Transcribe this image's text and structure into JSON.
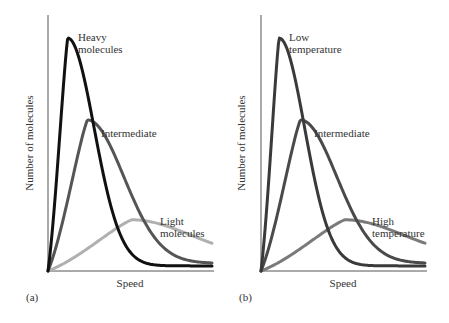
{
  "chart_data": [
    {
      "type": "line",
      "panel_label": "(a)",
      "title": "",
      "xlabel": "Speed",
      "ylabel": "Number of molecules",
      "grid": false,
      "ticks": false,
      "xlim": [
        0,
        1
      ],
      "ylim": [
        0,
        1
      ],
      "series": [
        {
          "name": "Heavy molecules",
          "label_lines": [
            "Heavy",
            "molecules"
          ],
          "color": "#111111",
          "peak_x": 0.12,
          "peak_y": 0.91,
          "tail_y": 0.02
        },
        {
          "name": "Intermediate",
          "label_lines": [
            "Intermediate"
          ],
          "color": "#555555",
          "peak_x": 0.24,
          "peak_y": 0.59,
          "tail_y": 0.03
        },
        {
          "name": "Light molecules",
          "label_lines": [
            "Light",
            "molecules"
          ],
          "color": "#b0b0b0",
          "peak_x": 0.51,
          "peak_y": 0.2,
          "tail_y": 0.05
        }
      ]
    },
    {
      "type": "line",
      "panel_label": "(b)",
      "title": "",
      "xlabel": "Speed",
      "ylabel": "Number of molecules",
      "grid": false,
      "ticks": false,
      "xlim": [
        0,
        1
      ],
      "ylim": [
        0,
        1
      ],
      "series": [
        {
          "name": "Low temperature",
          "label_lines": [
            "Low",
            "temperature"
          ],
          "color": "#3a3a3a",
          "peak_x": 0.11,
          "peak_y": 0.91,
          "tail_y": 0.02
        },
        {
          "name": "Intermediate",
          "label_lines": [
            "Intermediate"
          ],
          "color": "#4a4a4a",
          "peak_x": 0.24,
          "peak_y": 0.59,
          "tail_y": 0.03
        },
        {
          "name": "High temperature",
          "label_lines": [
            "High",
            "temperature"
          ],
          "color": "#7a7a7a",
          "peak_x": 0.51,
          "peak_y": 0.2,
          "tail_y": 0.05
        }
      ]
    }
  ]
}
